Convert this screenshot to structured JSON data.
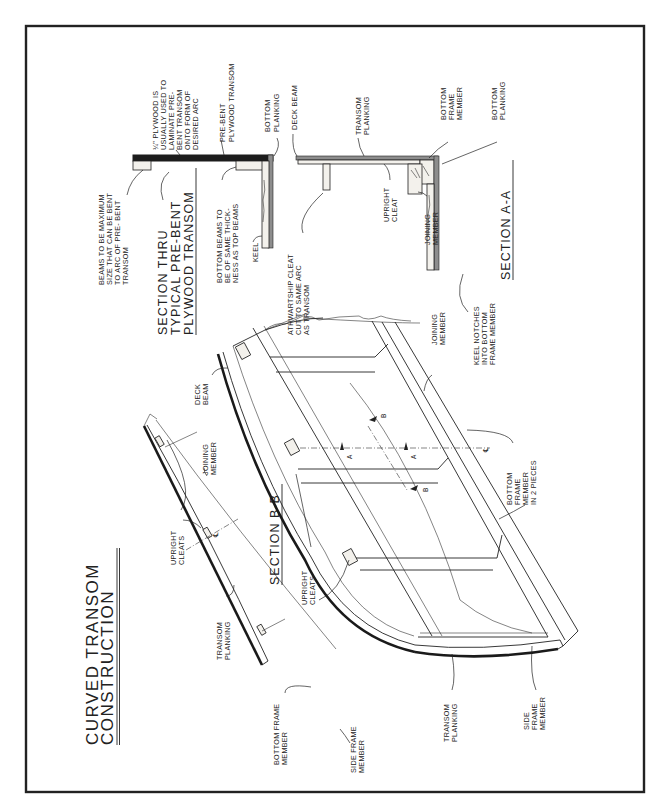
{
  "drawing": {
    "title_line1": "CURVED TRANSOM",
    "title_line2": "CONSTRUCTION",
    "orientation": "rotated -90 (text reads bottom to top)",
    "border_color": "#222222",
    "background": "#ffffff"
  },
  "section_typical": {
    "title_line1": "SECTION THRU",
    "title_line2": "TYPICAL PRE-BENT",
    "title_line3": "PLYWOOD TRANSOM",
    "labels": {
      "beams": [
        "BEAMS TO BE MAXIMUM",
        "SIZE THAT CAN BE BENT",
        "TO ARC OF PRE- BENT",
        "TRANSOM"
      ],
      "plywood": [
        "¼\" PLYWOOD IS",
        "USUALLY USED TO",
        "LAMINATE PRE-",
        "BENT TRANSOM",
        "ONTO FORM OF",
        "DESIRED ARC"
      ],
      "prebent": [
        "PRE-BENT",
        "PLYWOOD TRANSOM"
      ],
      "bottom_planking": [
        "BOTTOM",
        "PLANKING"
      ],
      "bottom_beams": [
        "BOTTOM BEAMS TO",
        "BE OF SAME THICK-",
        "NESS AS TOP BEAMS"
      ],
      "keel": [
        "KEEL"
      ]
    }
  },
  "section_aa": {
    "title": "SECTION A-A",
    "labels": {
      "deck_beam": [
        "DECK BEAM"
      ],
      "transom_planking": [
        "TRANSOM",
        "PLANKING"
      ],
      "bottom_frame_member": [
        "BOTTOM",
        "FRAME",
        "MEMBER"
      ],
      "bottom_planking": [
        "BOTTOM",
        "PLANKING"
      ],
      "upright_cleat": [
        "UPRIGHT",
        "CLEAT"
      ],
      "joining_member": [
        "JOINING",
        "MEMBER"
      ],
      "athwartship_cleat": [
        "ATHWARTSHIP CLEAT",
        "CUT TO SAME ARC",
        "AS TRANSOM"
      ],
      "keel_notches": [
        "KEEL NOTCHES",
        "INTO BOTTOM",
        "FRAME MEMBER"
      ]
    }
  },
  "section_bb": {
    "title": "SECTION B-B",
    "labels": {
      "joining_member": [
        "JOINING",
        "MEMBER"
      ],
      "upright_cleats": [
        "UPRIGHT",
        "CLEATS"
      ],
      "transom_planking": [
        "TRANSOM",
        "PLANKING"
      ],
      "bottom_frame_member": [
        "BOTTOM FRAME",
        "MEMBER"
      ],
      "side_frame_member": [
        "SIDE FRAME",
        "MEMBER"
      ],
      "centerline": "℄"
    }
  },
  "perspective_view": {
    "labels": {
      "deck_beam": [
        "DECK",
        "BEAM"
      ],
      "joining_member": [
        "JOINING",
        "MEMBER"
      ],
      "upright_cleats": [
        "UPRIGHT",
        "CLEATS"
      ],
      "bottom_frame_member": [
        "BOTTOM",
        "FRAME",
        "MEMBER",
        "IN 2 PIECES"
      ],
      "transom_planking": [
        "TRANSOM",
        "PLANKING"
      ],
      "side_frame_member": [
        "SIDE",
        "FRAME",
        "MEMBER"
      ],
      "centerline": "℄"
    },
    "section_marks": [
      "A",
      "A",
      "B",
      "B"
    ]
  }
}
